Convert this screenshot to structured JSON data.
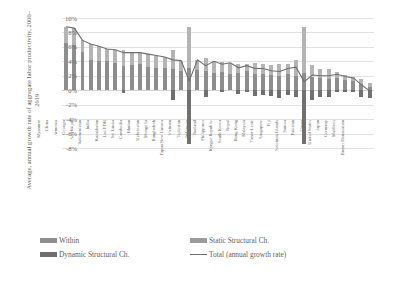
{
  "chart_data": {
    "type": "bar",
    "title": "",
    "xlabel": "",
    "ylabel": "Average, annual growth rate of aggregate labor productivity, 2000–2019",
    "ylim": [
      -8,
      10
    ],
    "ytick_labels": [
      "10%",
      "8%",
      "6%",
      "4%",
      "2%",
      "0%",
      "-2%",
      "-4%",
      "-6%",
      "-8%"
    ],
    "ytick_values": [
      10,
      8,
      6,
      4,
      2,
      0,
      -2,
      -4,
      -6,
      -8
    ],
    "grid": true,
    "legend_position": "bottom",
    "stacked": true,
    "categories": [
      "Myanmar",
      "China",
      "Armenia",
      "Georgia",
      "Azerbaijan",
      "Turkmenistan",
      "India",
      "Kazakhstan",
      "Lao PDR",
      "Sri Lanka",
      "Cambodia",
      "Bhutan",
      "Uzbekistan",
      "Mongolia",
      "Bangladesh",
      "Papua New Guinea",
      "Vietnam",
      "Tajikistan",
      "Indonesia",
      "Thailand",
      "Philippines",
      "Kyrgyz Republic",
      "South Korea",
      "Nepal",
      "Hong Kong",
      "Malaysia",
      "Timor-Leste",
      "Singapore",
      "Fiji",
      "Solomon Islands",
      "Samoa",
      "Pakistan",
      "Tonga",
      "United States",
      "Japan",
      "Germany",
      "Maldives",
      "Brunei Darussalam"
    ],
    "series": [
      {
        "name": "Within",
        "color": "#8d8d8d",
        "values": [
          6.6,
          6.2,
          5.3,
          4.2,
          4.1,
          4.0,
          3.8,
          3.3,
          3.5,
          3.6,
          3.2,
          3.1,
          3.1,
          3.0,
          2.6,
          3.1,
          2.8,
          2.6,
          2.4,
          2.5,
          2.2,
          2.4,
          2.6,
          2.2,
          2.3,
          2.1,
          2.0,
          2.3,
          2.0,
          2.4,
          1.9,
          1.7,
          1.6,
          1.7,
          1.4,
          1.3,
          0.9,
          0.5
        ]
      },
      {
        "name": "Static Structural Ch.",
        "color": "#b4b4b4",
        "values": [
          2.2,
          2.4,
          1.6,
          2.2,
          2.0,
          1.7,
          1.8,
          2.3,
          1.7,
          1.6,
          1.8,
          1.7,
          1.5,
          2.6,
          1.5,
          5.6,
          1.4,
          1.8,
          1.6,
          1.4,
          1.6,
          1.2,
          1.0,
          1.6,
          1.3,
          1.4,
          1.7,
          1.3,
          2.2,
          6.3,
          1.6,
          1.2,
          1.4,
          0.8,
          0.7,
          0.6,
          0.7,
          0.5
        ]
      },
      {
        "name": "Dynamic Structural Ch.",
        "color": "#707070",
        "values": [
          0.0,
          0.0,
          0.0,
          0.0,
          0.0,
          0.0,
          0.0,
          -0.4,
          0.0,
          0.0,
          0.0,
          0.0,
          0.0,
          -1.4,
          0.0,
          -7.4,
          0.0,
          -1.0,
          0.0,
          -0.3,
          0.0,
          -0.5,
          -0.2,
          -0.8,
          -0.6,
          -0.8,
          -1.1,
          -0.6,
          -1.0,
          -7.5,
          -1.4,
          -0.9,
          -1.0,
          -0.3,
          -0.2,
          -0.2,
          -0.9,
          -1.1
        ]
      }
    ],
    "line": {
      "name": "Total (annual growth rate)",
      "color": "#6e6e6e",
      "values": [
        8.8,
        8.6,
        6.9,
        6.4,
        6.1,
        5.7,
        5.6,
        5.2,
        5.2,
        5.2,
        5.0,
        4.8,
        4.6,
        4.2,
        4.1,
        1.3,
        4.2,
        3.4,
        4.0,
        3.6,
        3.8,
        3.1,
        3.4,
        3.0,
        3.0,
        2.7,
        2.6,
        3.0,
        3.2,
        1.2,
        2.1,
        2.0,
        2.0,
        2.2,
        1.9,
        1.7,
        0.7,
        -0.1
      ]
    }
  },
  "legend": {
    "items": [
      {
        "label": "Within",
        "kind": "swatch"
      },
      {
        "label": "Static Structural Ch.",
        "kind": "swatch"
      },
      {
        "label": "Dynamic Structural Ch.",
        "kind": "swatch"
      },
      {
        "label": "Total (annual growth rate)",
        "kind": "line"
      }
    ]
  }
}
